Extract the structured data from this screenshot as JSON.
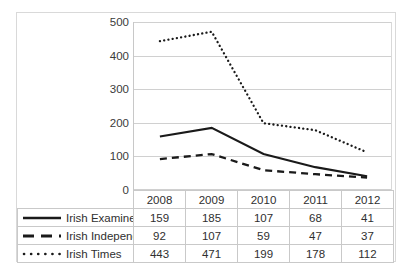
{
  "chart_data": {
    "type": "line",
    "title": "",
    "xlabel": "",
    "ylabel": "",
    "categories": [
      "2008",
      "2009",
      "2010",
      "2011",
      "2012"
    ],
    "ylim": [
      0,
      500
    ],
    "yticks": [
      "0",
      "100",
      "200",
      "300",
      "400",
      "500"
    ],
    "grid": true,
    "legend_position": "table-left",
    "series": [
      {
        "name": "Irish Examiner",
        "style": "solid",
        "values": [
          159,
          185,
          107,
          68,
          41
        ]
      },
      {
        "name": "Irish Independent",
        "style": "dashed",
        "values": [
          92,
          107,
          59,
          47,
          37
        ]
      },
      {
        "name": "Irish Times",
        "style": "dotted",
        "values": [
          443,
          471,
          199,
          178,
          112
        ]
      }
    ]
  },
  "axis": {
    "y_tick_0": "0",
    "y_tick_100": "100",
    "y_tick_200": "200",
    "y_tick_300": "300",
    "y_tick_400": "400",
    "y_tick_500": "500"
  },
  "table": {
    "header": [
      "2008",
      "2009",
      "2010",
      "2011",
      "2012"
    ],
    "rows": [
      {
        "label": "Irish Examiner",
        "values": [
          "159",
          "185",
          "107",
          "68",
          "41"
        ]
      },
      {
        "label": "Irish Independent",
        "values": [
          "92",
          "107",
          "59",
          "47",
          "37"
        ]
      },
      {
        "label": "Irish Times",
        "values": [
          "443",
          "471",
          "199",
          "178",
          "112"
        ]
      }
    ]
  },
  "colors": {
    "series_stroke": "#1a1a1a",
    "gridline": "#d0d0d0",
    "table_border": "#c9c9c9",
    "frame": "#d9d9d9",
    "background": "#ffffff"
  }
}
